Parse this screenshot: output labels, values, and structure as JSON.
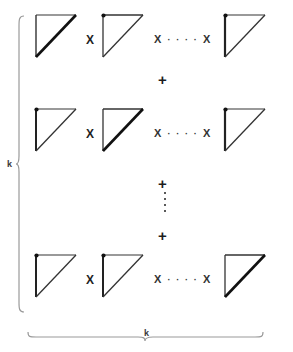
{
  "figure": {
    "type": "diagram",
    "labels": {
      "left_brace": "k",
      "bottom_brace": "k"
    },
    "operators": {
      "multiply": "X",
      "add": "+",
      "horizontal_ellipsis": "· · · ·",
      "vertical_ellipsis_dots": 4
    },
    "rows": [
      {
        "row_index": 0,
        "cells": [
          {
            "shape": "right-triangle",
            "vertex_dot": false,
            "bold_edge": "hypotenuse"
          },
          {
            "shape": "right-triangle",
            "vertex_dot": true,
            "bold_edge": "none"
          },
          {
            "shape": "right-triangle",
            "vertex_dot": true,
            "bold_edge": "left"
          }
        ],
        "between_cells": [
          "X",
          "X ···· X"
        ]
      },
      {
        "row_index": 1,
        "cells": [
          {
            "shape": "right-triangle",
            "vertex_dot": true,
            "bold_edge": "left"
          },
          {
            "shape": "right-triangle",
            "vertex_dot": false,
            "bold_edge": "hypotenuse"
          },
          {
            "shape": "right-triangle",
            "vertex_dot": true,
            "bold_edge": "left"
          }
        ],
        "between_cells": [
          "X",
          "X ···· X"
        ]
      },
      {
        "row_index": 2,
        "cells": [
          {
            "shape": "right-triangle",
            "vertex_dot": true,
            "bold_edge": "left"
          },
          {
            "shape": "right-triangle",
            "vertex_dot": true,
            "bold_edge": "left"
          },
          {
            "shape": "right-triangle",
            "vertex_dot": false,
            "bold_edge": "hypotenuse"
          }
        ],
        "between_cells": [
          "X",
          "X ···· X"
        ]
      }
    ],
    "between_rows": [
      "+",
      "+",
      "+"
    ],
    "colors": {
      "ink": "#1a1a1a",
      "brace": "#8a8a8a",
      "background": "#ffffff"
    }
  }
}
